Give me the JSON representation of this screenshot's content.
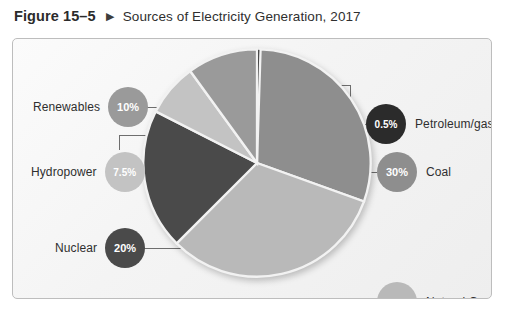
{
  "figure": {
    "number": "Figure 15–5",
    "arrow_icon": "triangle-right-icon",
    "arrow_glyph": "▶",
    "title": "Sources of Electricity Generation, 2017"
  },
  "chart_data": {
    "type": "pie",
    "title": "Sources of Electricity Generation, 2017",
    "subtitle": "",
    "xlabel": "",
    "ylabel": "",
    "legend_position": "callouts-around-pie",
    "grid": false,
    "units": "percent",
    "total": 99.5,
    "labels": [
      "Petroleum/gas",
      "Coal",
      "Natural Gas",
      "Nuclear",
      "Hydropower",
      "Renewables"
    ],
    "values": [
      0.5,
      30,
      32,
      20,
      7.5,
      10
    ],
    "value_labels": [
      "0.5%",
      "30%",
      "32%",
      "20%",
      "7.5%",
      "10%"
    ],
    "colors": [
      "#2b2b2b",
      "#8e8e8e",
      "#b9b9b9",
      "#4a4a4a",
      "#c3c3c3",
      "#9a9a9a"
    ],
    "slices": [
      {
        "name": "Petroleum/gas",
        "value": 0.5,
        "value_label": "0.5%",
        "color": "#2b2b2b",
        "badge_text_color": "#ffffff",
        "label_side": "right",
        "badge_left": 355,
        "badge_top": 65,
        "label_left": 401,
        "label_top": 78
      },
      {
        "name": "Coal",
        "value": 30,
        "value_label": "30%",
        "color": "#8e8e8e",
        "badge_text_color": "#ffffff",
        "label_side": "right",
        "badge_left": 366,
        "badge_top": 113,
        "label_left": 412,
        "label_top": 126
      },
      {
        "name": "Natural Gas",
        "value": 32,
        "value_label": "32%",
        "color": "#b9b9b9",
        "badge_text_color": "#ffffff",
        "label_side": "right",
        "badge_left": 366,
        "badge_top": 243,
        "label_left": 412,
        "label_top": 256
      },
      {
        "name": "Nuclear",
        "value": 20,
        "value_label": "20%",
        "color": "#4a4a4a",
        "badge_text_color": "#ffffff",
        "label_side": "left",
        "badge_left": 90,
        "badge_top": 189,
        "label_left": 42,
        "label_top": 202
      },
      {
        "name": "Hydropower",
        "value": 7.5,
        "value_label": "7.5%",
        "color": "#c3c3c3",
        "badge_text_color": "#ffffff",
        "label_side": "left",
        "badge_left": 86,
        "badge_top": 113,
        "label_left": 18,
        "label_top": 126
      },
      {
        "name": "Renewables",
        "value": 10,
        "value_label": "10%",
        "color": "#9a9a9a",
        "badge_text_color": "#ffffff",
        "label_side": "left",
        "badge_left": 86,
        "badge_top": 48,
        "label_left": 20,
        "label_top": 61
      }
    ]
  },
  "style": {
    "frame_border": "#bdbdbd",
    "leader_line": "#6e6e6e",
    "wedge_divider": "#f2f2f2",
    "page_background": "#ffffff"
  }
}
